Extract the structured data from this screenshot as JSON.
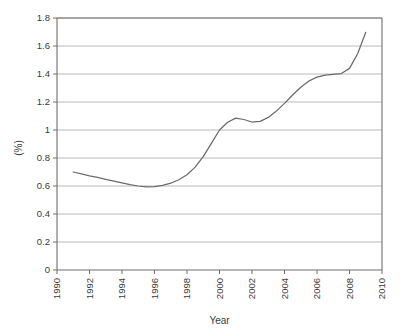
{
  "chart_data": {
    "type": "line",
    "title": "",
    "subtitle": "",
    "xlabel": "Year",
    "ylabel": "(%)",
    "xlim": [
      1990,
      2010
    ],
    "ylim": [
      0,
      1.8
    ],
    "grid": "horizontal",
    "legend": "none",
    "x_tick_labels": [
      "1990",
      "1992",
      "1994",
      "1996",
      "1998",
      "2000",
      "2002",
      "2004",
      "2006",
      "2008",
      "2010"
    ],
    "x_tick_values": [
      1990,
      1992,
      1994,
      1996,
      1998,
      2000,
      2002,
      2004,
      2006,
      2008,
      2010
    ],
    "y_tick_labels": [
      "0",
      "0.2",
      "0.4",
      "0.6",
      "0.8",
      "1",
      "1.2",
      "1.4",
      "1.6",
      "1.8"
    ],
    "y_tick_values": [
      0,
      0.2,
      0.4,
      0.6,
      0.8,
      1.0,
      1.2,
      1.4,
      1.6,
      1.8
    ],
    "x_tick_rotation": -90,
    "y_tick_rotation": 0,
    "ylabel_rotation": -90,
    "series": [
      {
        "name": "value",
        "x": [
          1991.0,
          1991.5,
          1992.0,
          1992.5,
          1993.0,
          1993.5,
          1994.0,
          1994.5,
          1995.0,
          1995.5,
          1996.0,
          1996.5,
          1997.0,
          1997.5,
          1998.0,
          1998.5,
          1999.0,
          1999.5,
          2000.0,
          2000.5,
          2001.0,
          2001.5,
          2002.0,
          2002.5,
          2003.0,
          2003.5,
          2004.0,
          2004.5,
          2005.0,
          2005.5,
          2006.0,
          2006.5,
          2007.0,
          2007.5,
          2008.0,
          2008.5,
          2009.0
        ],
        "values": [
          0.7,
          0.687,
          0.673,
          0.661,
          0.648,
          0.635,
          0.622,
          0.61,
          0.6,
          0.593,
          0.596,
          0.605,
          0.62,
          0.645,
          0.68,
          0.735,
          0.81,
          0.905,
          1.0,
          1.055,
          1.085,
          1.075,
          1.057,
          1.062,
          1.09,
          1.135,
          1.19,
          1.25,
          1.305,
          1.35,
          1.378,
          1.392,
          1.398,
          1.403,
          1.44,
          1.545,
          1.698
        ]
      }
    ],
    "annotations": [],
    "colors": {
      "line": "#6b6b6b",
      "gridline": "#b2b2b2",
      "axis": "#6e6e6e",
      "text": "#3a3a3a",
      "background": "#ffffff"
    },
    "notes": {
      "minimum_value": 0.593,
      "minimum_year": 1995.5,
      "local_max_value": 1.085,
      "local_max_year": 2001,
      "local_dip_value": 1.057,
      "local_dip_year": 2002,
      "plateau_value": 1.4,
      "plateau_range": "2006-2007.5",
      "final_value": 1.698,
      "final_year": 2009,
      "start_value": 0.7,
      "start_year": 1991
    }
  }
}
